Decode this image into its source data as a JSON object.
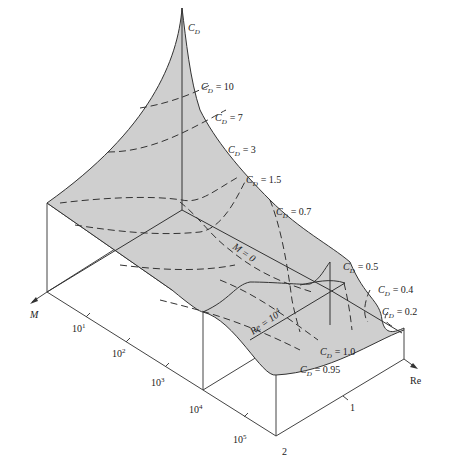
{
  "figure": {
    "axes": {
      "vertical": {
        "label": "C",
        "subscript": "D"
      },
      "mach": {
        "label": "M",
        "ticks": [
          "1",
          "2"
        ]
      },
      "reynolds": {
        "label": "Re",
        "ticks": [
          "10",
          "10",
          "10",
          "10",
          "10"
        ],
        "exponents": [
          "1",
          "2",
          "3",
          "4",
          "5"
        ]
      }
    },
    "contours": [
      {
        "label": "C",
        "sub": "D",
        "value": "= 10"
      },
      {
        "label": "C",
        "sub": "D",
        "value": "= 7"
      },
      {
        "label": "C",
        "sub": "D",
        "value": "= 3"
      },
      {
        "label": "C",
        "sub": "D",
        "value": "= 1.5"
      },
      {
        "label": "C",
        "sub": "D",
        "value": "= 0.7"
      },
      {
        "label": "C",
        "sub": "D",
        "value": "= 0.5"
      },
      {
        "label": "C",
        "sub": "D",
        "value": "= 0.4"
      },
      {
        "label": "C",
        "sub": "D",
        "value": "= 0.2"
      },
      {
        "label": "C",
        "sub": "D",
        "value": "= 1.0"
      },
      {
        "label": "C",
        "sub": "D",
        "value": "= 0.95"
      }
    ],
    "section_labels": {
      "m_zero": "M = 0",
      "re_base": "Re = 10",
      "re_exp": "4"
    }
  }
}
